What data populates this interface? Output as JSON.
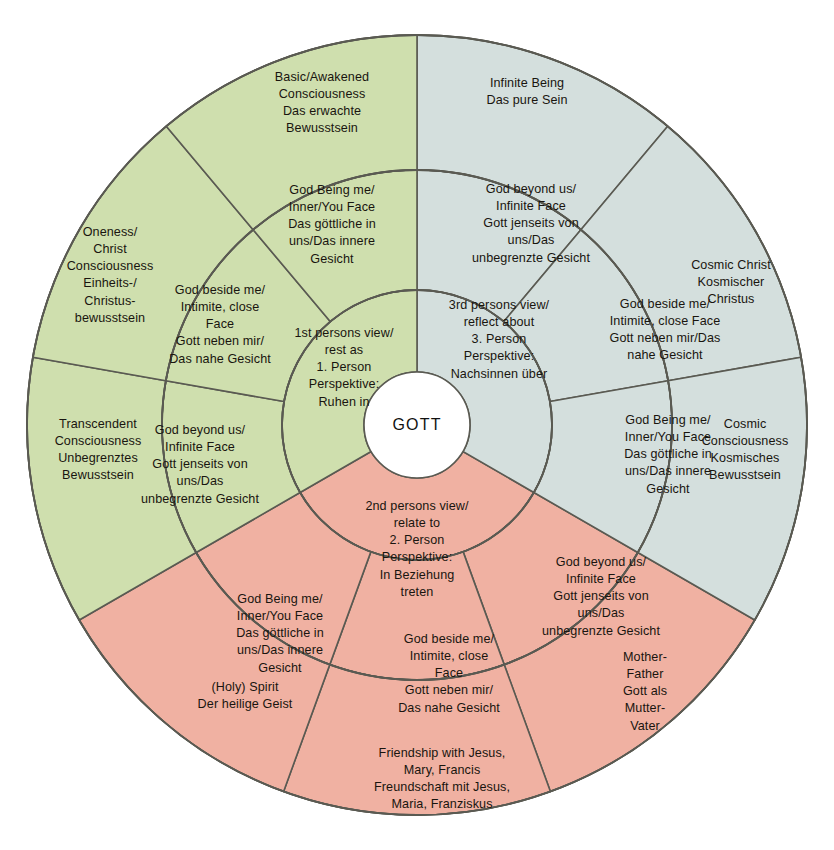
{
  "diagram": {
    "title": "GOTT",
    "center": {
      "label": "GOTT",
      "name": "center-gott"
    },
    "colors": {
      "green": "#cfdfae",
      "blue_gray": "#d4dfdd",
      "pink": "#f0b1a2",
      "stroke": "#5a5a52",
      "center_fill": "#ffffff",
      "text": "#19150f"
    },
    "rings": [
      {
        "name": "inner-ring",
        "radius_px": 135
      },
      {
        "name": "middle-ring",
        "radius_px": 255
      },
      {
        "name": "outer-ring",
        "radius_px": 390
      }
    ],
    "sectors": [
      {
        "id": "green",
        "name": "first-person-sector",
        "color": "#cfdfae",
        "inner": {
          "label": "1st persons view/\nrest as\n1. Person\nPerspektive:\nRuhen in",
          "x": 344,
          "y": 368
        },
        "middle": [
          {
            "label": "God Being me/\nInner/You Face\nDas göttliche in\nuns/Das innere\nGesicht",
            "x": 332,
            "y": 225
          },
          {
            "label": "God beside me/\nIntimite, close\nFace\nGott neben mir/\nDas nahe Gesicht",
            "x": 220,
            "y": 325
          },
          {
            "label": "God beyond us/\nInfinite Face\nGott jenseits von\nuns/Das\nunbegrenzte Gesicht",
            "x": 200,
            "y": 465
          }
        ],
        "outer": [
          {
            "label": "Basic/Awakened\nConsciousness\nDas erwachte\nBewusstsein",
            "x": 322,
            "y": 103
          },
          {
            "label": "Oneness/\nChrist\nConsciousness\nEinheits-/\nChristus-\nbewusstsein",
            "x": 110,
            "y": 275
          },
          {
            "label": "Transcendent\nConsciousness\nUnbegrenztes\nBewusstsein",
            "x": 98,
            "y": 450
          }
        ]
      },
      {
        "id": "blue_gray",
        "name": "third-person-sector",
        "color": "#d4dfdd",
        "inner": {
          "label": "3rd persons view/\nreflect about\n3. Person\nPerspektive:\nNachsinnen über",
          "x": 499,
          "y": 340
        },
        "middle": [
          {
            "label": "God beyond us/\nInfinite Face\nGott jenseits von\nuns/Das\nunbegrenzte Gesicht",
            "x": 531,
            "y": 224
          },
          {
            "label": "God beside me/\nIntimite, close Face\nGott neben mir/Das\nnahe Gesicht",
            "x": 665,
            "y": 330
          },
          {
            "label": "God Being me/\nInner/You Face\nDas göttliche in\nuns/Das innere\nGesicht",
            "x": 668,
            "y": 455
          }
        ],
        "outer": [
          {
            "label": "Infinite Being\nDas pure Sein",
            "x": 527,
            "y": 92
          },
          {
            "label": "Cosmic Christ\nKosmischer\nChristus",
            "x": 731,
            "y": 283
          },
          {
            "label": "Cosmic\nConsciousness\nKosmisches\nBewusstsein",
            "x": 745,
            "y": 450
          }
        ]
      },
      {
        "id": "pink",
        "name": "second-person-sector",
        "color": "#f0b1a2",
        "inner": {
          "label": "2nd persons view/\nrelate to\n2. Person\nPerspektive:\nIn Beziehung\ntreten",
          "x": 417,
          "y": 549
        },
        "middle": [
          {
            "label": "God Being me/\nInner/You Face\nDas göttliche in\nuns/Das innere\nGesicht",
            "x": 280,
            "y": 634
          },
          {
            "label": "God beside me/\nIntimite, close\nFace\nGott neben mir/\nDas nahe Gesicht",
            "x": 449,
            "y": 674
          },
          {
            "label": "God beyond us/\nInfinite Face\nGott jenseits von\nuns/Das\nunbegrenzte Gesicht",
            "x": 601,
            "y": 597
          }
        ],
        "outer": [
          {
            "label": "(Holy) Spirit\nDer heilige Geist",
            "x": 245,
            "y": 696
          },
          {
            "label": "Friendship with Jesus,\nMary, Francis\nFreundschaft mit Jesus,\nMaria, Franziskus",
            "x": 442,
            "y": 779
          },
          {
            "label": "Mother-\nFather\nGott als\nMutter-\nVater",
            "x": 645,
            "y": 692
          }
        ]
      }
    ]
  }
}
